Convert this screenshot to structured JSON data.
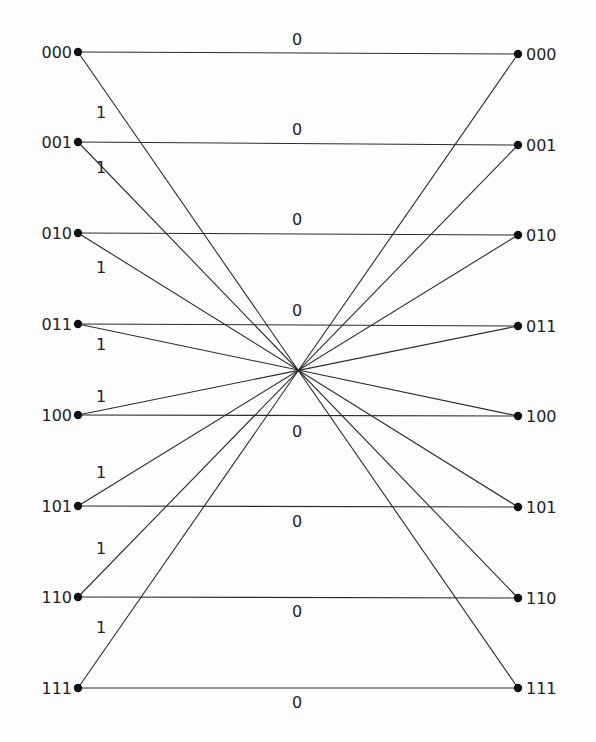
{
  "diagram": {
    "type": "butterfly-network",
    "width": 596,
    "height": 742,
    "colors": {
      "line": "#2b2b2b",
      "node": "#111111",
      "text": "#222222",
      "background": "#fdfdfd"
    },
    "crossing_point": {
      "x": 297,
      "y": 370
    },
    "left_nodes": [
      {
        "label": "000",
        "x": 78,
        "y": 52
      },
      {
        "label": "001",
        "x": 78,
        "y": 142
      },
      {
        "label": "010",
        "x": 78,
        "y": 233
      },
      {
        "label": "011",
        "x": 78,
        "y": 324
      },
      {
        "label": "100",
        "x": 78,
        "y": 415
      },
      {
        "label": "101",
        "x": 78,
        "y": 506
      },
      {
        "label": "110",
        "x": 78,
        "y": 597
      },
      {
        "label": "111",
        "x": 78,
        "y": 688
      }
    ],
    "right_nodes": [
      {
        "label": "000",
        "x": 518,
        "y": 54
      },
      {
        "label": "001",
        "x": 518,
        "y": 145
      },
      {
        "label": "010",
        "x": 518,
        "y": 235
      },
      {
        "label": "011",
        "x": 518,
        "y": 326
      },
      {
        "label": "100",
        "x": 518,
        "y": 416
      },
      {
        "label": "101",
        "x": 518,
        "y": 507
      },
      {
        "label": "110",
        "x": 518,
        "y": 598
      },
      {
        "label": "111",
        "x": 518,
        "y": 688
      }
    ],
    "zero_edges": [
      {
        "from": 0,
        "to": 0,
        "label": "0",
        "label_x": 297,
        "label_y": 45
      },
      {
        "from": 1,
        "to": 1,
        "label": "0",
        "label_x": 297,
        "label_y": 135
      },
      {
        "from": 2,
        "to": 2,
        "label": "0",
        "label_x": 297,
        "label_y": 225
      },
      {
        "from": 3,
        "to": 3,
        "label": "0",
        "label_x": 297,
        "label_y": 316
      },
      {
        "from": 4,
        "to": 4,
        "label": "0",
        "label_x": 297,
        "label_y": 437
      },
      {
        "from": 5,
        "to": 5,
        "label": "0",
        "label_x": 297,
        "label_y": 527
      },
      {
        "from": 6,
        "to": 6,
        "label": "0",
        "label_x": 297,
        "label_y": 617
      },
      {
        "from": 7,
        "to": 7,
        "label": "0",
        "label_x": 297,
        "label_y": 708
      }
    ],
    "one_edges": [
      {
        "from": 0,
        "to": 7,
        "label": "1",
        "label_x": 101,
        "label_y": 118
      },
      {
        "from": 1,
        "to": 6,
        "label": "1",
        "label_x": 101,
        "label_y": 173
      },
      {
        "from": 2,
        "to": 5,
        "label": "1",
        "label_x": 101,
        "label_y": 273
      },
      {
        "from": 3,
        "to": 4,
        "label": "1",
        "label_x": 101,
        "label_y": 350
      },
      {
        "from": 4,
        "to": 3,
        "label": "1",
        "label_x": 101,
        "label_y": 402
      },
      {
        "from": 5,
        "to": 2,
        "label": "1",
        "label_x": 101,
        "label_y": 478
      },
      {
        "from": 6,
        "to": 1,
        "label": "1",
        "label_x": 101,
        "label_y": 554
      },
      {
        "from": 7,
        "to": 0,
        "label": "1",
        "label_x": 101,
        "label_y": 633
      }
    ]
  }
}
